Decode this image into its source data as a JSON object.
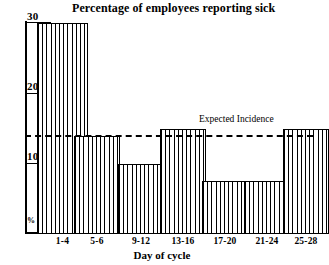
{
  "chart_data": {
    "type": "bar",
    "title": "Percentage of employees reporting sick",
    "xlabel": "Day of cycle",
    "ylabel": "%",
    "categories": [
      "1-4",
      "5-6",
      "9-12",
      "13-16",
      "17-20",
      "21-24",
      "25-28"
    ],
    "values": [
      30,
      14,
      10,
      15,
      7.5,
      7.5,
      15
    ],
    "ylim": [
      0,
      30
    ],
    "yticks": [
      10,
      20,
      30
    ],
    "ytick_labels": [
      "10",
      "20",
      "30"
    ],
    "grid": false,
    "legend": "none",
    "annotations": [
      {
        "name": "expected-incidence",
        "label": "Expected Incidence",
        "type": "horizontal-dashed-line",
        "value": 14
      }
    ],
    "bar_style": {
      "fill": "vertical-hatch",
      "outline_color": "#000000",
      "fill_color": "#ffffff"
    }
  },
  "axis": {
    "y_unit_label": "%",
    "tick_30": "30",
    "tick_20": "20",
    "tick_10": "10"
  }
}
